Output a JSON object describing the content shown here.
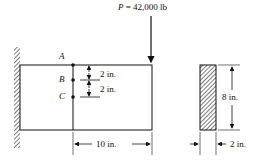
{
  "load": {
    "symbol": "P",
    "value": " = 42,000 lb"
  },
  "points": {
    "a": "A",
    "b": "B",
    "c": "C"
  },
  "dims": {
    "ab": "2 in.",
    "bc": "2 in.",
    "span": "10 in.",
    "height": "8 in.",
    "width": "2 in."
  }
}
